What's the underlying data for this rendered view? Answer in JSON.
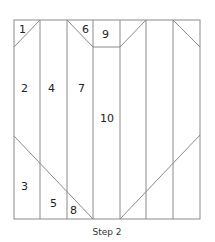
{
  "diagram": {
    "caption": "Step 2",
    "line_color": "#8a8a8a",
    "pieces": [
      {
        "id": "1",
        "label": "1"
      },
      {
        "id": "2",
        "label": "2"
      },
      {
        "id": "3",
        "label": "3"
      },
      {
        "id": "4",
        "label": "4"
      },
      {
        "id": "5",
        "label": "5"
      },
      {
        "id": "6",
        "label": "6"
      },
      {
        "id": "7",
        "label": "7"
      },
      {
        "id": "8",
        "label": "8"
      },
      {
        "id": "9",
        "label": "9"
      },
      {
        "id": "10",
        "label": "10"
      }
    ]
  }
}
